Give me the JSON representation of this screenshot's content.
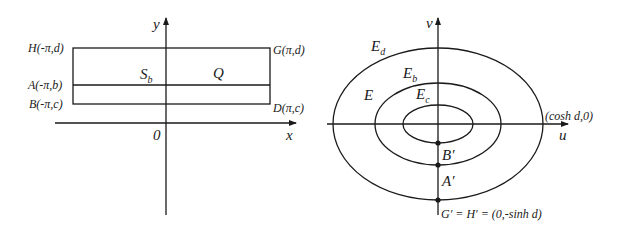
{
  "left_panel": {
    "axes": {
      "x_label": "x",
      "y_label": "y",
      "origin_label": "0"
    },
    "points": {
      "H": "H(-π,d)",
      "A": "A(-π,b)",
      "B": "B(-π,c)",
      "G": "G(π,d)",
      "D": "D(π,c)"
    },
    "regions": {
      "S_main": "S",
      "S_sub": "b",
      "Q": "Q"
    }
  },
  "right_panel": {
    "axes": {
      "u_label": "u",
      "v_label": "v"
    },
    "ellipses": {
      "outer": {
        "main": "E",
        "sub": "d"
      },
      "middle": {
        "main": "E",
        "sub": "b"
      },
      "inner": {
        "main": "E",
        "sub": "c"
      }
    },
    "region_label": "E",
    "points": {
      "cosh": "(cosh d,0)",
      "B_prime": "B′",
      "A_prime": "A′",
      "GH": "G′ = H′ = (0,-sinh d)"
    }
  },
  "colors": {
    "ink": "#1a1a1a",
    "background": "#ffffff"
  }
}
